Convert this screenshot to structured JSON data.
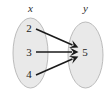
{
  "diagram": {
    "type": "mapping-diagram",
    "title": "",
    "background_color": "#ffffff",
    "domain_set": {
      "label": "x",
      "ellipse": {
        "cx": 30.5,
        "cy": 53,
        "rx": 17.5,
        "ry": 35
      },
      "label_pos": {
        "x": 30.5,
        "y": 12
      },
      "elements": [
        {
          "value": "2",
          "x": 28,
          "y": 31
        },
        {
          "value": "3",
          "x": 28,
          "y": 55
        },
        {
          "value": "4",
          "x": 28,
          "y": 77
        }
      ]
    },
    "codomain_set": {
      "label": "y",
      "ellipse": {
        "cx": 85.5,
        "cy": 55,
        "rx": 17.5,
        "ry": 33
      },
      "label_pos": {
        "x": 85.5,
        "y": 12
      },
      "elements": [
        {
          "value": "5",
          "x": 85,
          "y": 59
        }
      ]
    },
    "arrows": [
      {
        "from": "2",
        "to": "5",
        "x1": 36,
        "y1": 29,
        "x2": 77,
        "y2": 47
      },
      {
        "from": "3",
        "to": "5",
        "x1": 36,
        "y1": 52,
        "x2": 77,
        "y2": 52
      },
      {
        "from": "4",
        "to": "5",
        "x1": 36,
        "y1": 75,
        "x2": 77,
        "y2": 57
      }
    ],
    "colors": {
      "ellipse_fill": "#e9e9e9",
      "ellipse_stroke": "#b4b4b4",
      "arrow": "#1a1a1a",
      "text": "#1c1c1c"
    }
  }
}
